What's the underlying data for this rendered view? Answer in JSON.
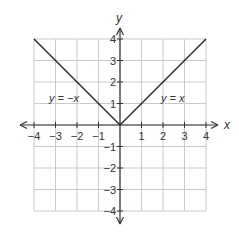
{
  "chart_data": {
    "type": "line",
    "title": "",
    "xlabel": "x",
    "ylabel": "y",
    "xlim": [
      -4,
      4
    ],
    "ylim": [
      -4,
      4
    ],
    "grid": true,
    "x_ticks": [
      "-4",
      "-3",
      "-2",
      "-1",
      "1",
      "2",
      "3",
      "4"
    ],
    "y_ticks": [
      "4",
      "3",
      "2",
      "1",
      "-1",
      "-2",
      "-3",
      "-4"
    ],
    "series": [
      {
        "name": "y = -x",
        "x": [
          -4,
          -3,
          -2,
          -1,
          0
        ],
        "y": [
          4,
          3,
          2,
          1,
          0
        ]
      },
      {
        "name": "y = x",
        "x": [
          0,
          1,
          2,
          3,
          4
        ],
        "y": [
          0,
          1,
          2,
          3,
          4
        ]
      }
    ],
    "annotations": [
      {
        "text": "y = −x",
        "x": -3,
        "y": 1.5
      },
      {
        "text": "y = x",
        "x": 2.5,
        "y": 1.5
      }
    ]
  },
  "labels": {
    "x_axis": "x",
    "y_axis": "y",
    "eq_left": "y = −x",
    "eq_right": "y = x",
    "xt": [
      "−4",
      "−3",
      "−2",
      "−1",
      "1",
      "2",
      "3",
      "4"
    ],
    "yt": [
      "4",
      "3",
      "2",
      "1",
      "−1",
      "−2",
      "−3",
      "−4"
    ]
  },
  "colors": {
    "grid": "#c8c8c8",
    "axis": "#333333",
    "line": "#222222"
  }
}
